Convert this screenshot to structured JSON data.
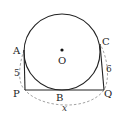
{
  "figure": {
    "type": "geometry-diagram",
    "colors": {
      "stroke": "#222222",
      "dashed": "#888888",
      "background": "#ffffff"
    },
    "points": {
      "center": {
        "label": "O"
      },
      "A": {
        "label": "A"
      },
      "B": {
        "label": "B"
      },
      "C": {
        "label": "C"
      },
      "P": {
        "label": "P"
      },
      "Q": {
        "label": "Q"
      }
    },
    "measurements": {
      "AP": "5",
      "CQ": "6",
      "PQ_arc": "x"
    }
  }
}
